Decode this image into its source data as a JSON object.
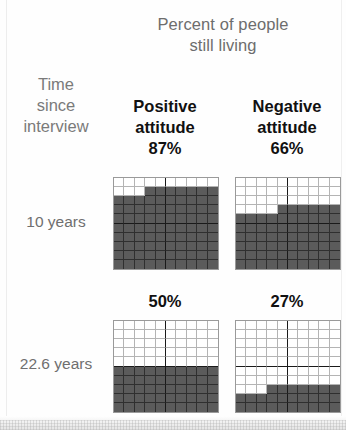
{
  "figure": {
    "title": "Percent of people\nstill living",
    "title_line1": "Percent of people",
    "title_line2": "still living",
    "row_header_title_line1": "Time",
    "row_header_title_line2": "since",
    "row_header_title_line3": "interview",
    "colors": {
      "filled": "#5b5b5b",
      "empty": "#ffffff",
      "grid_line": "#b4b4b4",
      "heavy_line": "#1a1a1a",
      "border": "#9a9a9a",
      "title_text": "#6d6d6d",
      "header_text": "#111111",
      "row_label_text": "#6f6f6f"
    }
  },
  "columns": [
    {
      "label_line1": "Positive",
      "label_line2": "attitude",
      "percent_label": "87%"
    },
    {
      "label_line1": "Negative",
      "label_line2": "attitude",
      "percent_label": "66%"
    }
  ],
  "rows": [
    {
      "label": "10 years"
    },
    {
      "label": "22.6 years"
    }
  ],
  "captions_row2": [
    "50%",
    "27%"
  ],
  "chart_data": {
    "type": "waffle",
    "title": "Percent of people still living",
    "xlabel": "",
    "ylabel": "Time since interview",
    "grid_size": [
      10,
      10
    ],
    "unit": "1 square = 1 percent",
    "categories": [
      "Positive attitude",
      "Negative attitude"
    ],
    "row_categories": [
      "10 years",
      "22.6 years"
    ],
    "series": [
      {
        "name": "10 years",
        "values": [
          87,
          66
        ]
      },
      {
        "name": "22.6 years",
        "values": [
          50,
          27
        ]
      }
    ],
    "cells": [
      {
        "row": "10 years",
        "column": "Positive attitude",
        "value": 87,
        "label": "87%",
        "filled_squares": 87,
        "empty_squares": 13,
        "fill_order": "bottom-up, left-to-right",
        "empty_description": "top row fully empty (10), second row 3 leftmost empty"
      },
      {
        "row": "10 years",
        "column": "Negative attitude",
        "value": 66,
        "label": "66%",
        "filled_squares": 66,
        "empty_squares": 34,
        "fill_order": "bottom-up, left-to-right",
        "empty_description": "top 3 rows fully empty (30), fourth row 4 leftmost empty"
      },
      {
        "row": "22.6 years",
        "column": "Positive attitude",
        "value": 50,
        "label": "50%",
        "filled_squares": 50,
        "empty_squares": 50,
        "fill_order": "bottom-up, left-to-right",
        "empty_description": "top 5 rows fully empty"
      },
      {
        "row": "22.6 years",
        "column": "Negative attitude",
        "value": 27,
        "label": "27%",
        "filled_squares": 27,
        "empty_squares": 73,
        "fill_order": "bottom-up, left-to-right",
        "empty_description": "top 7 rows fully empty (70), eighth row 3 leftmost empty"
      }
    ],
    "grid": true,
    "legend": "none"
  }
}
